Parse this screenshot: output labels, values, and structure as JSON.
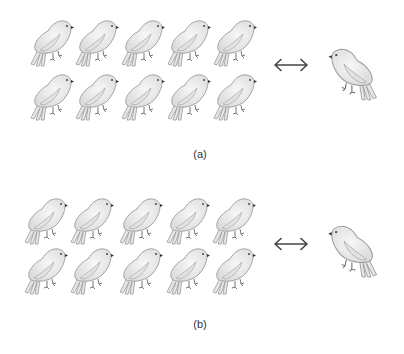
{
  "figure": {
    "panels": [
      {
        "id": "a",
        "caption": "(a)",
        "group": {
          "rows": 2,
          "cols": 5,
          "count": 10,
          "icon": "bird-icon",
          "facing": "right"
        },
        "relation": {
          "icon": "double-headed-arrow-icon",
          "symbol": "↔"
        },
        "single": {
          "count": 1,
          "icon": "bird-icon",
          "facing": "left"
        }
      },
      {
        "id": "b",
        "caption": "(b)",
        "group": {
          "rows": 2,
          "cols": 5,
          "count": 10,
          "icon": "bird-icon",
          "facing": "right"
        },
        "relation": {
          "icon": "double-headed-arrow-icon",
          "symbol": "↔"
        },
        "single": {
          "count": 1,
          "icon": "bird-icon",
          "facing": "left"
        }
      }
    ],
    "colors": {
      "bird_fill": "#ececec",
      "bird_stroke": "#9a9a9a",
      "arrow": "#444444",
      "caption": "#333333",
      "background": "#ffffff"
    }
  }
}
